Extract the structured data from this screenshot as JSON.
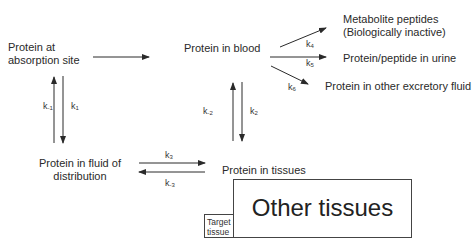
{
  "nodes": {
    "absorption": {
      "line1": "Protein at",
      "line2": "absorption site"
    },
    "blood": {
      "label": "Protein in blood"
    },
    "metabolite": {
      "line1": "Metabolite peptides",
      "line2": "(Biologically inactive)"
    },
    "urine": {
      "label": "Protein/peptide in urine"
    },
    "excretory": {
      "label": "Protein in other excretory fluid"
    },
    "fluid": {
      "line1": "Protein in fluid of",
      "line2": "distribution"
    },
    "tissues": {
      "label": "Protein in tissues"
    },
    "other_tissues": {
      "label": "Other tissues"
    },
    "target_tissue": {
      "line1": "Target",
      "line2": "tissue"
    }
  },
  "rates": {
    "k_minus1": {
      "base": "k",
      "sub": "-1"
    },
    "k1": {
      "base": "k",
      "sub": "1"
    },
    "k_minus2": {
      "base": "k",
      "sub": "-2"
    },
    "k2": {
      "base": "k",
      "sub": "2"
    },
    "k3": {
      "base": "k",
      "sub": "3"
    },
    "k_minus3": {
      "base": "k",
      "sub": "-3"
    },
    "k4": {
      "base": "k",
      "sub": "4"
    },
    "k5": {
      "base": "k",
      "sub": "5"
    },
    "k6": {
      "base": "k",
      "sub": "6"
    }
  },
  "colors": {
    "line": "#2a2a2a",
    "text": "#2a2a2a",
    "background": "#ffffff"
  }
}
